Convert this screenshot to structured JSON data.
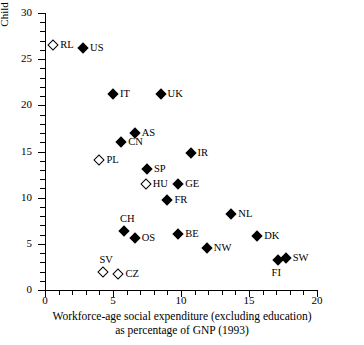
{
  "chart_data": {
    "type": "scatter",
    "title": "",
    "xlabel": "Workforce-age social expenditure (excluding education) as percentage of GNP (1993)",
    "xlabel_line1": "Workforce-age social expenditure (excluding education)",
    "xlabel_line2": "as percentage of GNP (1993)",
    "ylabel": "Child poverty rate (%)",
    "xlim": [
      0,
      20
    ],
    "ylim": [
      0,
      30
    ],
    "xticks": [
      0,
      5,
      10,
      15,
      20
    ],
    "yticks": [
      0,
      5,
      10,
      15,
      20,
      25,
      30
    ],
    "xtick_labels": [
      "0",
      "5",
      "10",
      "15",
      "20"
    ],
    "ytick_labels": [
      "0",
      "5",
      "10",
      "15",
      "20",
      "25",
      "30"
    ],
    "x_minor_step": 1,
    "y_minor_step": 1,
    "grid": false,
    "legend": false,
    "marker_styles": {
      "filled": "filled-diamond",
      "open": "open-diamond"
    },
    "points": [
      {
        "label": "RL",
        "x": 0.6,
        "y": 26.5,
        "marker": "open",
        "label_pos": "right"
      },
      {
        "label": "US",
        "x": 2.8,
        "y": 26.2,
        "marker": "filled",
        "label_pos": "right"
      },
      {
        "label": "IT",
        "x": 5.0,
        "y": 21.2,
        "marker": "filled",
        "label_pos": "right"
      },
      {
        "label": "UK",
        "x": 8.5,
        "y": 21.2,
        "marker": "filled",
        "label_pos": "right"
      },
      {
        "label": "AS",
        "x": 6.6,
        "y": 17.0,
        "marker": "filled",
        "label_pos": "right"
      },
      {
        "label": "CN",
        "x": 5.6,
        "y": 16.0,
        "marker": "filled",
        "label_pos": "right"
      },
      {
        "label": "IR",
        "x": 10.7,
        "y": 14.8,
        "marker": "filled",
        "label_pos": "right"
      },
      {
        "label": "PL",
        "x": 4.0,
        "y": 14.1,
        "marker": "open",
        "label_pos": "right"
      },
      {
        "label": "SP",
        "x": 7.5,
        "y": 13.1,
        "marker": "filled",
        "label_pos": "right"
      },
      {
        "label": "HU",
        "x": 7.4,
        "y": 11.5,
        "marker": "open",
        "label_pos": "right"
      },
      {
        "label": "GE",
        "x": 9.8,
        "y": 11.5,
        "marker": "filled",
        "label_pos": "right"
      },
      {
        "label": "FR",
        "x": 9.0,
        "y": 9.8,
        "marker": "filled",
        "label_pos": "right"
      },
      {
        "label": "NL",
        "x": 13.7,
        "y": 8.2,
        "marker": "filled",
        "label_pos": "right"
      },
      {
        "label": "CH",
        "x": 5.8,
        "y": 6.4,
        "marker": "filled",
        "label_pos": "above"
      },
      {
        "label": "BE",
        "x": 9.8,
        "y": 6.1,
        "marker": "filled",
        "label_pos": "right"
      },
      {
        "label": "DK",
        "x": 15.6,
        "y": 5.8,
        "marker": "filled",
        "label_pos": "right"
      },
      {
        "label": "OS",
        "x": 6.6,
        "y": 5.6,
        "marker": "filled",
        "label_pos": "right"
      },
      {
        "label": "NW",
        "x": 11.9,
        "y": 4.5,
        "marker": "filled",
        "label_pos": "right"
      },
      {
        "label": "SW",
        "x": 17.7,
        "y": 3.5,
        "marker": "filled",
        "label_pos": "right"
      },
      {
        "label": "FI",
        "x": 17.1,
        "y": 3.2,
        "marker": "filled",
        "label_pos": "below"
      },
      {
        "label": "SV",
        "x": 4.3,
        "y": 2.0,
        "marker": "open",
        "label_pos": "above"
      },
      {
        "label": "CZ",
        "x": 5.4,
        "y": 1.7,
        "marker": "open",
        "label_pos": "right"
      }
    ]
  }
}
